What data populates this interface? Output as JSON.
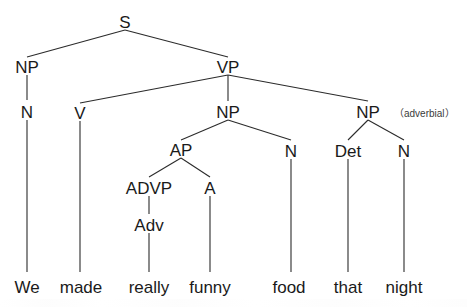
{
  "diagram": {
    "sentence": "We made really funny food that night",
    "annotation": "（adverbial）",
    "line_color": "#2b2b2b",
    "text_color": "#1a1a1a",
    "background_color": "#ffffff",
    "nodes": {
      "s": "S",
      "np_subject": "NP",
      "n_subject": "N",
      "vp": "VP",
      "v": "V",
      "np_object": "NP",
      "ap": "AP",
      "advp": "ADVP",
      "adv": "Adv",
      "a": "A",
      "n_object": "N",
      "np_adverbial": "NP",
      "det": "Det",
      "n_adverbial": "N"
    },
    "leaves": {
      "we": "We",
      "made": "made",
      "really": "really",
      "funny": "funny",
      "food": "food",
      "that": "that",
      "night": "night"
    }
  }
}
